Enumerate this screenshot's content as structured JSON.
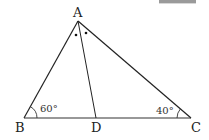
{
  "diagram": {
    "type": "triangle",
    "vertices": {
      "A": {
        "label": "A",
        "x": 78,
        "y": 21
      },
      "B": {
        "label": "B",
        "x": 24,
        "y": 118
      },
      "C": {
        "label": "C",
        "x": 191,
        "y": 118
      },
      "D": {
        "label": "D",
        "x": 96,
        "y": 118
      }
    },
    "segments": [
      [
        "A",
        "B"
      ],
      [
        "A",
        "C"
      ],
      [
        "B",
        "C"
      ],
      [
        "A",
        "D"
      ]
    ],
    "angles": {
      "B": {
        "label": "60°",
        "value": 60
      },
      "C": {
        "label": "40°",
        "value": 40
      },
      "A_bisected": {
        "marker": "dot",
        "count": 2
      }
    },
    "colors": {
      "stroke": "#222222",
      "text": "#222222",
      "background": "#ffffff",
      "topbar": "#9a9a9a"
    }
  }
}
